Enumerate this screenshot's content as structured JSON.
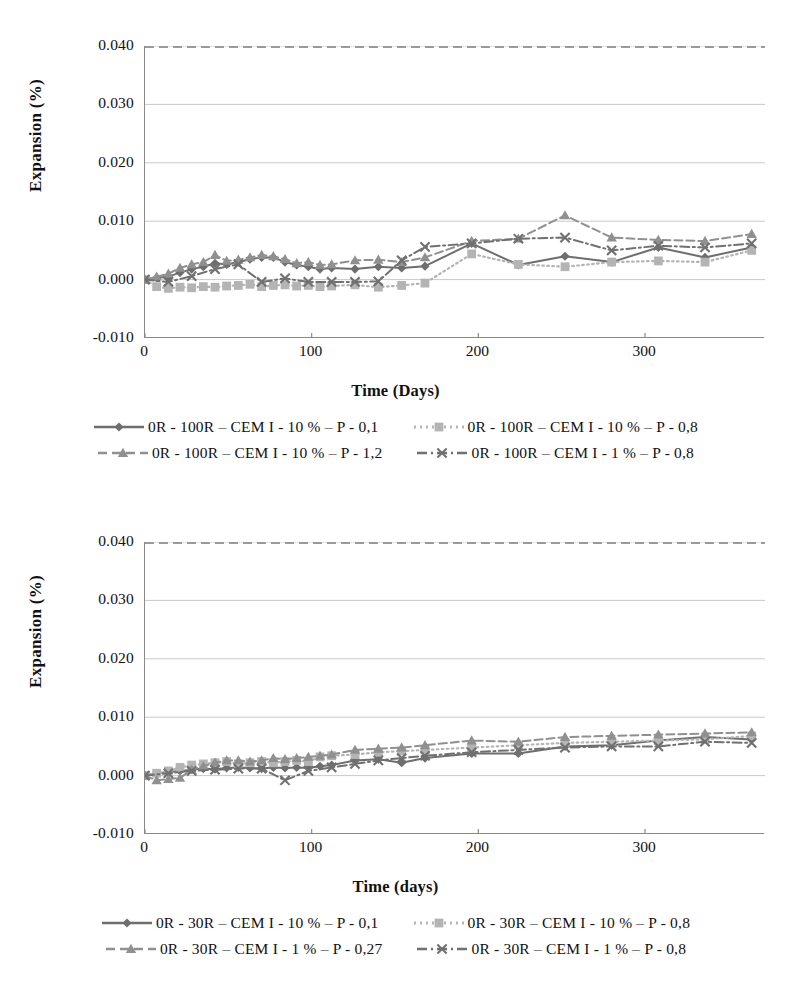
{
  "chart_data": [
    {
      "id": "top",
      "type": "line",
      "title": "",
      "xlabel": "Time (Days)",
      "ylabel": "Expansion (%)",
      "xlim": [
        0,
        372
      ],
      "ylim": [
        -0.01,
        0.04
      ],
      "xticks": [
        "0",
        "100",
        "200",
        "300"
      ],
      "xtick_values": [
        0,
        100,
        200,
        300
      ],
      "yticks": [
        "0.040",
        "0.030",
        "0.020",
        "0.010",
        "0.000",
        "-0.010"
      ],
      "ytick_values": [
        0.04,
        0.03,
        0.02,
        0.01,
        0.0,
        -0.01
      ],
      "grid": true,
      "legend_position": "below",
      "series": [
        {
          "name": "0R - 100R – CEM I - 10 % – P - 0,1",
          "marker": "diamond",
          "line": "solid",
          "color": "#6e6e6e",
          "x": [
            0,
            7,
            14,
            21,
            28,
            35,
            42,
            49,
            56,
            63,
            70,
            77,
            84,
            91,
            98,
            105,
            112,
            126,
            140,
            154,
            168,
            196,
            224,
            252,
            280,
            308,
            336,
            364
          ],
          "y": [
            0.0,
            0.0003,
            0.0005,
            0.0012,
            0.0018,
            0.0022,
            0.0028,
            0.0026,
            0.003,
            0.0035,
            0.0038,
            0.0038,
            0.003,
            0.0025,
            0.0022,
            0.0018,
            0.002,
            0.0018,
            0.0022,
            0.002,
            0.0023,
            0.0062,
            0.0025,
            0.004,
            0.003,
            0.0055,
            0.0038,
            0.0055
          ]
        },
        {
          "name": "0R - 100R – CEM I - 10 % – P - 0,8",
          "marker": "square",
          "line": "dotted",
          "color": "#b4b4b4",
          "x": [
            0,
            7,
            14,
            21,
            28,
            35,
            42,
            49,
            56,
            63,
            70,
            77,
            84,
            91,
            98,
            105,
            112,
            126,
            140,
            154,
            168,
            196,
            224,
            252,
            280,
            308,
            336,
            364
          ],
          "y": [
            0.0,
            -0.0012,
            -0.0015,
            -0.0013,
            -0.0014,
            -0.0012,
            -0.0013,
            -0.0011,
            -0.001,
            -0.0008,
            -0.0012,
            -0.001,
            -0.0009,
            -0.0011,
            -0.001,
            -0.0012,
            -0.0011,
            -0.0009,
            -0.0013,
            -0.001,
            -0.0006,
            0.0044,
            0.0026,
            0.0022,
            0.003,
            0.0032,
            0.003,
            0.005
          ]
        },
        {
          "name": "0R - 100R – CEM I - 10 % – P - 1,2",
          "marker": "triangle",
          "line": "dashed",
          "color": "#909090",
          "x": [
            0,
            7,
            14,
            21,
            28,
            35,
            42,
            49,
            56,
            63,
            70,
            77,
            84,
            91,
            98,
            105,
            112,
            126,
            140,
            154,
            168,
            196,
            224,
            252,
            280,
            308,
            336,
            364
          ],
          "y": [
            0.0,
            0.0005,
            0.001,
            0.002,
            0.0026,
            0.003,
            0.0042,
            0.0032,
            0.0034,
            0.0038,
            0.0042,
            0.004,
            0.0035,
            0.0028,
            0.003,
            0.0025,
            0.0026,
            0.0033,
            0.0034,
            0.003,
            0.0038,
            0.0066,
            0.007,
            0.011,
            0.0072,
            0.0068,
            0.0066,
            0.0078
          ]
        },
        {
          "name": "0R - 100R – CEM I - 1 % – P - 0,8",
          "marker": "x",
          "line": "dash-dot",
          "color": "#707070",
          "x": [
            0,
            14,
            28,
            42,
            56,
            70,
            84,
            98,
            112,
            126,
            140,
            154,
            168,
            196,
            224,
            252,
            280,
            308,
            336,
            364
          ],
          "y": [
            0.0,
            -0.0004,
            0.0006,
            0.0018,
            0.0026,
            -0.0004,
            0.0002,
            -0.0004,
            -0.0004,
            -0.0004,
            -0.0003,
            0.0033,
            0.0056,
            0.0062,
            0.007,
            0.0072,
            0.005,
            0.0058,
            0.0055,
            0.0062
          ]
        }
      ],
      "legend": [
        "0R - 100R – CEM I - 10 % – P - 0,1",
        "0R - 100R – CEM I - 10 % – P - 0,8",
        "0R - 100R – CEM I - 10 % – P - 1,2",
        "0R - 100R – CEM I - 1 % – P - 0,8"
      ]
    },
    {
      "id": "bottom",
      "type": "line",
      "title": "",
      "xlabel": "Time (days)",
      "ylabel": "Expansion (%)",
      "xlim": [
        0,
        372
      ],
      "ylim": [
        -0.01,
        0.04
      ],
      "xticks": [
        "0",
        "100",
        "200",
        "300"
      ],
      "xtick_values": [
        0,
        100,
        200,
        300
      ],
      "yticks": [
        "0.040",
        "0.030",
        "0.020",
        "0.010",
        "0.000",
        "-0.010"
      ],
      "ytick_values": [
        0.04,
        0.03,
        0.02,
        0.01,
        0.0,
        -0.01
      ],
      "grid": true,
      "legend_position": "below",
      "series": [
        {
          "name": "0R - 30R – CEM I - 10 % – P - 0,1",
          "marker": "diamond",
          "line": "solid",
          "color": "#6e6e6e",
          "x": [
            0,
            7,
            14,
            21,
            28,
            35,
            42,
            49,
            56,
            63,
            70,
            77,
            84,
            91,
            98,
            105,
            112,
            126,
            140,
            154,
            168,
            196,
            224,
            252,
            280,
            308,
            336,
            364
          ],
          "y": [
            0.0,
            0.0004,
            0.0006,
            0.0008,
            0.001,
            0.0012,
            0.0011,
            0.0013,
            0.0014,
            0.0013,
            0.0012,
            0.0014,
            0.0013,
            0.0014,
            0.0013,
            0.0016,
            0.0018,
            0.0026,
            0.0028,
            0.0022,
            0.003,
            0.0038,
            0.0038,
            0.005,
            0.0052,
            0.006,
            0.0066,
            0.0062
          ]
        },
        {
          "name": "0R - 30R – CEM I - 10 % – P - 0,8",
          "marker": "square",
          "line": "dotted",
          "color": "#b4b4b4",
          "x": [
            0,
            7,
            14,
            21,
            28,
            35,
            42,
            49,
            56,
            63,
            70,
            77,
            84,
            91,
            98,
            105,
            112,
            126,
            140,
            154,
            168,
            196,
            224,
            252,
            280,
            308,
            336,
            364
          ],
          "y": [
            0.0,
            0.0004,
            0.0008,
            0.0014,
            0.0018,
            0.002,
            0.0022,
            0.0024,
            0.002,
            0.0022,
            0.0024,
            0.0022,
            0.0024,
            0.0026,
            0.0024,
            0.0032,
            0.0034,
            0.0036,
            0.004,
            0.0042,
            0.0044,
            0.0048,
            0.0052,
            0.0056,
            0.0058,
            0.006,
            0.0062,
            0.0068
          ]
        },
        {
          "name": "0R - 30R – CEM I - 1 % – P - 0,27",
          "marker": "triangle",
          "line": "dashed",
          "color": "#909090",
          "x": [
            0,
            7,
            14,
            21,
            28,
            35,
            42,
            49,
            56,
            63,
            70,
            77,
            84,
            91,
            98,
            105,
            112,
            126,
            140,
            154,
            168,
            196,
            224,
            252,
            280,
            308,
            336,
            364
          ],
          "y": [
            0.0,
            -0.0008,
            -0.0006,
            -0.0004,
            0.001,
            0.0016,
            0.0022,
            0.0026,
            0.0026,
            0.0024,
            0.0026,
            0.003,
            0.0028,
            0.003,
            0.0032,
            0.0034,
            0.0036,
            0.0044,
            0.0046,
            0.0048,
            0.0052,
            0.006,
            0.0058,
            0.0066,
            0.0068,
            0.007,
            0.0072,
            0.0074
          ]
        },
        {
          "name": "0R - 30R – CEM I - 1 % – P - 0,8",
          "marker": "x",
          "line": "dash-dot",
          "color": "#707070",
          "x": [
            0,
            14,
            28,
            42,
            56,
            70,
            84,
            98,
            112,
            126,
            140,
            154,
            168,
            196,
            224,
            252,
            280,
            308,
            336,
            364
          ],
          "y": [
            0.0,
            0.0004,
            0.0008,
            0.001,
            0.0012,
            0.0012,
            -0.0008,
            0.0008,
            0.0014,
            0.002,
            0.0026,
            0.003,
            0.0034,
            0.004,
            0.0044,
            0.0048,
            0.005,
            0.005,
            0.0058,
            0.0056
          ]
        }
      ],
      "legend": [
        "0R - 30R – CEM I - 10 % – P - 0,1",
        "0R - 30R – CEM I - 10 % – P - 0,8",
        "0R - 30R – CEM I - 1 % – P - 0,27",
        "0R - 30R – CEM I - 1 % – P - 0,8"
      ]
    }
  ],
  "colors": {
    "axis": "#8a8a8a",
    "grid": "#c9c9c9",
    "text": "#111111",
    "series_dark": "#6e6e6e",
    "series_mid": "#909090",
    "series_light": "#b4b4b4"
  }
}
